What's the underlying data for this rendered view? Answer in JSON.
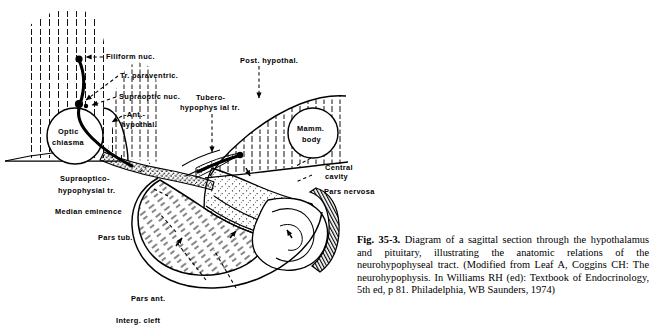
{
  "figure": {
    "id": "fig-35-3",
    "number_label": "Fig. 35-3.",
    "caption_text": "Diagram of a sagittal section through the hypothalamus and pituitary, illustrating the anatomic relations of the neurohypophyseal tract. (Modified from Leaf A, Coggins CH: The neurohypophysis. In Williams RH (ed): Textbook of Endocrinology, 5th ed, p 81. Philadelphia, WB Saunders, 1974)",
    "background_color": "#ffffff",
    "ink_color": "#000000"
  },
  "labels": {
    "filiform_nuc": "Filiform  nuc.",
    "tr_paraventric": "Tr.  paraventric.",
    "supraoptic_nuc": "Supraoptic  nuc.",
    "ant_hypothal_line1": "-Ant.-",
    "ant_hypothal_line2": "hypothal.",
    "optic_chiasma_line1": "Optic",
    "optic_chiasma_line2": "chiasma",
    "post_hypothal": "Post.  hypothal.",
    "tubero_line1": "Tubero-",
    "tubero_line2": "hypophys ial tr.",
    "mamm_body_line1": "Mamm.",
    "mamm_body_line2": "body",
    "central_cavity_line1": "Central",
    "central_cavity_line2": "cavity",
    "pars_nervosa": "Pars  nervosa",
    "supraoptico_line1": "Supraoptico-",
    "supraoptico_line2": "hypophysial tr.",
    "median_eminence": "Median   eminence",
    "pars_tub": "Pars  tub.",
    "pars_ant": "Pars  ant.",
    "interg_cleft": "Interg.  cleft"
  }
}
